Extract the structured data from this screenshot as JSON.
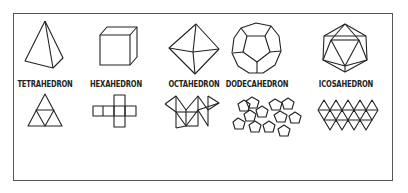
{
  "solids": [
    {
      "name": "TETRAHEDRON",
      "faces": 4,
      "face_shape": "triangle"
    },
    {
      "name": "HEXAHEDRON",
      "faces": 6,
      "face_shape": "square"
    },
    {
      "name": "OCTAHEDRON",
      "faces": 8,
      "face_shape": "triangle"
    },
    {
      "name": "DODECAHEDRON",
      "faces": 12,
      "face_shape": "pentagon"
    },
    {
      "name": "ICOSAHEDRON",
      "faces": 20,
      "face_shape": "triangle"
    }
  ],
  "colors": {
    "stroke": "#222222",
    "frame": "#555555",
    "background": "#ffffff"
  }
}
